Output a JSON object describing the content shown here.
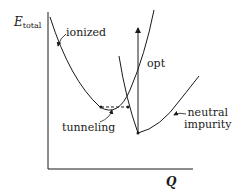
{
  "diagram": {
    "axes": {
      "y_label_main": "E",
      "y_label_sub": "total",
      "x_label": "Q"
    },
    "curves": [
      {
        "name": "ionized",
        "label": "ionized"
      },
      {
        "name": "neutral impurity",
        "label_line1": "neutral",
        "label_line2": "impurity"
      }
    ],
    "annotations": {
      "optical_transition": "opt",
      "tunneling": "tunneling"
    },
    "colors": {
      "line": "#1a1a1a",
      "background": "#ffffff"
    }
  }
}
